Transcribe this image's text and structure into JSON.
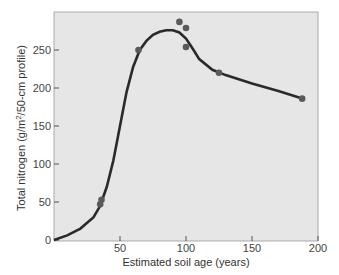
{
  "chart_data": {
    "type": "scatter",
    "title": "",
    "xlabel": "Estimated soil age (years)",
    "ylabel": "Total nitrogen (g/m²/50-cm profile)",
    "ylabel_pre": "Total nitrogen (g/m",
    "ylabel_sup": "2",
    "ylabel_post": "/50-cm profile)",
    "xlim": [
      0,
      200
    ],
    "ylim": [
      0,
      300
    ],
    "xticks": [
      50,
      100,
      150,
      200
    ],
    "yticks": [
      0,
      50,
      100,
      150,
      200,
      250
    ],
    "grid": false,
    "legend": null,
    "series": [
      {
        "name": "Observed",
        "type": "scatter",
        "x": [
          35,
          36,
          64,
          95,
          100,
          100,
          125,
          188
        ],
        "y": [
          47,
          53,
          250,
          287,
          279,
          254,
          220,
          186
        ]
      },
      {
        "name": "Fitted curve",
        "type": "line",
        "x": [
          0,
          10,
          20,
          30,
          35,
          40,
          45,
          50,
          55,
          60,
          65,
          70,
          75,
          80,
          85,
          90,
          95,
          100,
          105,
          110,
          120,
          130,
          150,
          170,
          188
        ],
        "y": [
          0,
          6,
          15,
          30,
          45,
          70,
          105,
          150,
          195,
          228,
          250,
          262,
          270,
          274,
          276,
          276,
          273,
          265,
          252,
          238,
          224,
          217,
          206,
          196,
          186
        ]
      }
    ],
    "colors": {
      "background": "#e6e6e6",
      "line": "#2a2a2a",
      "points": "#5a5a5a"
    }
  }
}
